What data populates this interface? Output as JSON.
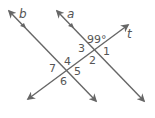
{
  "diagram": {
    "type": "parallel-lines-transversal",
    "lines": [
      {
        "id": "b",
        "label": "b",
        "parallel_mark": true
      },
      {
        "id": "a",
        "label": "a",
        "parallel_mark": true
      },
      {
        "id": "t",
        "label": "t",
        "parallel_mark": false
      }
    ],
    "given_angle": {
      "label": "99°",
      "position": "above intersection of a and t"
    },
    "angle_labels": {
      "angle1": "1",
      "angle2": "2",
      "angle3": "3",
      "angle4": "4",
      "angle5": "5",
      "angle6": "6",
      "angle7": "7"
    },
    "colors": {
      "line": "#666666",
      "text": "#555555",
      "background": "#ffffff"
    }
  }
}
